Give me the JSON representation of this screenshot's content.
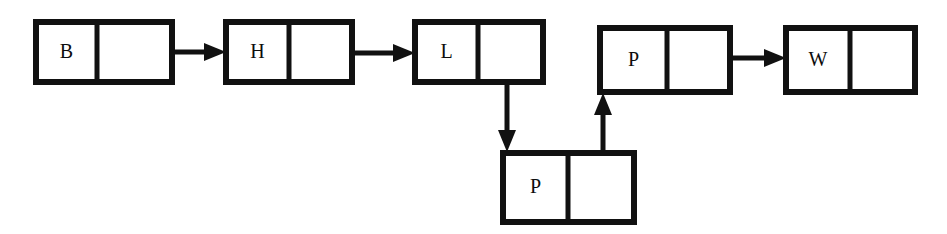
{
  "diagram": {
    "kind": "linked-list",
    "background_color": "#ffffff",
    "ink_color": "#111111",
    "nodes": [
      {
        "id": "node-b",
        "label": "B",
        "box": {
          "x": 36,
          "y": 22,
          "width": 136,
          "height": 60
        },
        "divider_x": 97,
        "pointer_cell": "occupied",
        "order": 1
      },
      {
        "id": "node-h",
        "label": "H",
        "box": {
          "x": 226,
          "y": 22,
          "width": 126,
          "height": 60
        },
        "divider_x": 289,
        "pointer_cell": "occupied",
        "order": 2
      },
      {
        "id": "node-l",
        "label": "L",
        "box": {
          "x": 415,
          "y": 22,
          "width": 128,
          "height": 60
        },
        "divider_x": 478,
        "pointer_cell": "occupied",
        "order": 3
      },
      {
        "id": "node-p-lower",
        "label": "P",
        "box": {
          "x": 503,
          "y": 153,
          "width": 131,
          "height": 69
        },
        "divider_x": 568,
        "pointer_cell": "occupied",
        "order": 4
      },
      {
        "id": "node-p-upper",
        "label": "P",
        "box": {
          "x": 600,
          "y": 28,
          "width": 130,
          "height": 64
        },
        "divider_x": 667,
        "pointer_cell": "occupied",
        "order": 5
      },
      {
        "id": "node-w",
        "label": "W",
        "box": {
          "x": 786,
          "y": 28,
          "width": 129,
          "height": 64
        },
        "divider_x": 850,
        "pointer_cell": "empty",
        "order": 6
      }
    ],
    "links": [
      {
        "id": "link-b-to-h",
        "from": "node-b",
        "to": "node-h",
        "direction": "right",
        "origin": {
          "x": 130,
          "y": 52
        },
        "tip": {
          "x": 226,
          "y": 52
        }
      },
      {
        "id": "link-h-to-l",
        "from": "node-h",
        "to": "node-l",
        "direction": "right",
        "origin": {
          "x": 318,
          "y": 53
        },
        "tip": {
          "x": 415,
          "y": 53
        }
      },
      {
        "id": "link-l-to-p-lower",
        "from": "node-l",
        "to": "node-p-lower",
        "direction": "down",
        "origin": {
          "x": 507,
          "y": 55
        },
        "tip": {
          "x": 507,
          "y": 152
        }
      },
      {
        "id": "link-p-lower-to-p-upper",
        "from": "node-p-lower",
        "to": "node-p-upper",
        "direction": "up",
        "origin": {
          "x": 603,
          "y": 189
        },
        "tip": {
          "x": 603,
          "y": 93
        }
      },
      {
        "id": "link-p-upper-to-w",
        "from": "node-p-upper",
        "to": "node-w",
        "direction": "right",
        "origin": {
          "x": 692,
          "y": 58
        },
        "tip": {
          "x": 786,
          "y": 58
        }
      }
    ]
  }
}
